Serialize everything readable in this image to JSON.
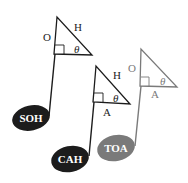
{
  "colors": {
    "dark": "#1c1c1c",
    "gray": "#7a7a7a",
    "background": "#ffffff",
    "note_text": "#ffffff"
  },
  "notes": [
    {
      "id": "soh",
      "label": "SOH",
      "meaning": "Sine = Opposite / Hypotenuse",
      "color": "dark",
      "triangle_labels": {
        "opposite": "O",
        "hypotenuse": "H",
        "angle": "θ"
      }
    },
    {
      "id": "cah",
      "label": "CAH",
      "meaning": "Cosine = Adjacent / Hypotenuse",
      "color": "dark",
      "triangle_labels": {
        "hypotenuse": "H",
        "adjacent": "A",
        "angle": "θ"
      }
    },
    {
      "id": "toa",
      "label": "TOA",
      "meaning": "Tangent = Opposite / Adjacent",
      "color": "gray",
      "triangle_labels": {
        "opposite": "O",
        "adjacent": "A",
        "angle": "θ"
      }
    }
  ]
}
